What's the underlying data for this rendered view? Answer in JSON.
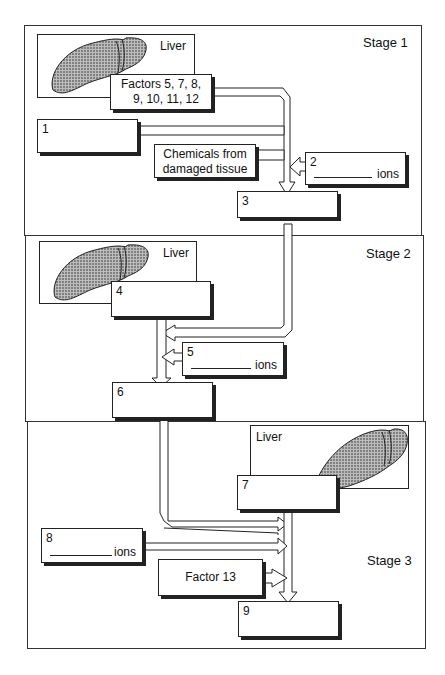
{
  "diagram": {
    "stages": [
      {
        "label": "Stage 1",
        "liver_label": "Liver",
        "factors_label_line1": "Factors 5, 7, 8,",
        "factors_label_line2": "9, 10, 11, 12",
        "box1_num": "1",
        "chemicals_line1": "Chemicals from",
        "chemicals_line2": "damaged tissue",
        "box2_num": "2",
        "box2_suffix": "ions",
        "box3_num": "3"
      },
      {
        "label": "Stage 2",
        "liver_label": "Liver",
        "box4_num": "4",
        "box5_num": "5",
        "box5_suffix": "ions",
        "box6_num": "6"
      },
      {
        "label": "Stage 3",
        "liver_label": "Liver",
        "box7_num": "7",
        "box8_num": "8",
        "box8_suffix": "ions",
        "factor13_label": "Factor 13",
        "box9_num": "9"
      }
    ],
    "colors": {
      "line": "#222222",
      "background": "#ffffff",
      "liver_fill": "#9a9a9a"
    }
  }
}
